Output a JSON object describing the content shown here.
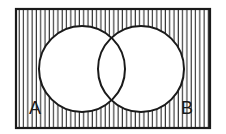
{
  "diagram": {
    "type": "venn",
    "shaded_region": "complement of A union B",
    "universe": {
      "x": 16,
      "y": 9,
      "width": 194,
      "height": 119,
      "hatch": "vertical",
      "hatch_spacing": 4.3
    },
    "sets": [
      {
        "id": "A",
        "label": "A",
        "cx": 82,
        "cy": 69,
        "r": 43
      },
      {
        "id": "B",
        "label": "B",
        "cx": 141,
        "cy": 69,
        "r": 43
      }
    ],
    "labels": {
      "A": {
        "text": "A",
        "x": 29,
        "y": 114
      },
      "B": {
        "text": "B",
        "x": 181,
        "y": 114
      }
    },
    "colors": {
      "stroke": "#1a1a1a",
      "background": "#ffffff",
      "hatch": "#2a2a2a"
    }
  }
}
